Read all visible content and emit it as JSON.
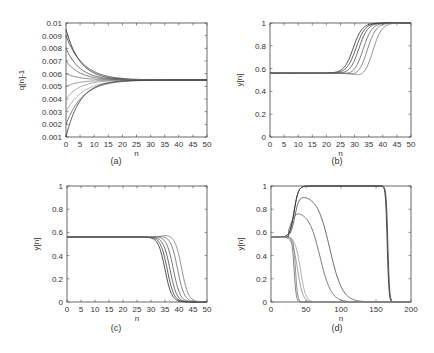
{
  "chart_data": [
    {
      "id": "a",
      "type": "line",
      "caption": "(a)",
      "xlabel": "n",
      "ylabel": "q[n]-1",
      "xlim": [
        0,
        50
      ],
      "ylim": [
        0.001,
        0.01
      ],
      "xticks": [
        "0",
        "5",
        "10",
        "15",
        "20",
        "25",
        "30",
        "35",
        "40",
        "45",
        "50"
      ],
      "yticks": [
        "0.001",
        "0.002",
        "0.003",
        "0.004",
        "0.005",
        "0.006",
        "0.007",
        "0.008",
        "0.009",
        "0.01"
      ],
      "grid": false,
      "description": "Multiple curves starting at different initial values (0.001 to 0.0095) converging to ~0.0055 by n≈25",
      "series": [
        {
          "name": "s1",
          "start": 0.0095,
          "end": 0.0055,
          "tau": 5
        },
        {
          "name": "s2",
          "start": 0.009,
          "end": 0.0055,
          "tau": 6
        },
        {
          "name": "s3",
          "start": 0.008,
          "end": 0.0055,
          "tau": 5
        },
        {
          "name": "s4",
          "start": 0.007,
          "end": 0.0055,
          "tau": 5
        },
        {
          "name": "s5",
          "start": 0.006,
          "end": 0.0055,
          "tau": 5
        },
        {
          "name": "s6",
          "start": 0.005,
          "end": 0.0055,
          "tau": 5
        },
        {
          "name": "s7",
          "start": 0.004,
          "end": 0.0055,
          "tau": 5
        },
        {
          "name": "s8",
          "start": 0.003,
          "end": 0.0055,
          "tau": 6
        },
        {
          "name": "s9",
          "start": 0.002,
          "end": 0.0055,
          "tau": 6
        },
        {
          "name": "s10",
          "start": 0.001,
          "end": 0.0055,
          "tau": 5
        }
      ]
    },
    {
      "id": "b",
      "type": "line",
      "caption": "(b)",
      "xlabel": "n",
      "ylabel": "y[n]",
      "xlim": [
        0,
        50
      ],
      "ylim": [
        0,
        1
      ],
      "xticks": [
        "0",
        "5",
        "10",
        "15",
        "20",
        "25",
        "30",
        "35",
        "40",
        "45",
        "50"
      ],
      "yticks": [
        "0",
        "0.2",
        "0.4",
        "0.6",
        "0.8",
        "1"
      ],
      "grid": false,
      "description": "Curves flat at ~0.56 then rising sigmoidally to 1 between n≈25 and n≈40",
      "series": [
        {
          "name": "s1",
          "base": 0.56,
          "mid": 29.5,
          "dip": 0.0
        },
        {
          "name": "s2",
          "base": 0.56,
          "mid": 30.5,
          "dip": 0.0
        },
        {
          "name": "s3",
          "base": 0.56,
          "mid": 31.5,
          "dip": 0.01
        },
        {
          "name": "s4",
          "base": 0.56,
          "mid": 33.0,
          "dip": 0.02
        },
        {
          "name": "s5",
          "base": 0.56,
          "mid": 34.5,
          "dip": 0.03
        },
        {
          "name": "s6",
          "base": 0.56,
          "mid": 36.5,
          "dip": 0.04
        }
      ]
    },
    {
      "id": "c",
      "type": "line",
      "caption": "(c)",
      "xlabel": "n",
      "ylabel": "y[n]",
      "xlim": [
        0,
        50
      ],
      "ylim": [
        0,
        1
      ],
      "xticks": [
        "0",
        "5",
        "10",
        "15",
        "20",
        "25",
        "30",
        "35",
        "40",
        "45",
        "50"
      ],
      "yticks": [
        "0",
        "0.2",
        "0.4",
        "0.6",
        "0.8",
        "1"
      ],
      "grid": false,
      "description": "Curves flat at ~0.56 then falling sigmoidally to 0 between n≈30 and n≈44",
      "series": [
        {
          "name": "s1",
          "base": 0.56,
          "mid": 35.0,
          "bump": 0.0
        },
        {
          "name": "s2",
          "base": 0.56,
          "mid": 35.8,
          "bump": 0.0
        },
        {
          "name": "s3",
          "base": 0.56,
          "mid": 36.8,
          "bump": 0.0
        },
        {
          "name": "s4",
          "base": 0.56,
          "mid": 38.0,
          "bump": 0.005
        },
        {
          "name": "s5",
          "base": 0.56,
          "mid": 39.5,
          "bump": 0.01
        },
        {
          "name": "s6",
          "base": 0.56,
          "mid": 41.0,
          "bump": 0.02
        }
      ]
    },
    {
      "id": "d",
      "type": "line",
      "caption": "(d)",
      "xlabel": "n",
      "ylabel": "y[n]",
      "xlim": [
        0,
        200
      ],
      "ylim": [
        0,
        1
      ],
      "xticks": [
        "0",
        "50",
        "100",
        "150",
        "200"
      ],
      "yticks": [
        "0",
        "0.2",
        "0.4",
        "0.6",
        "0.8",
        "1"
      ],
      "grid": false,
      "description": "Curves starting at ~0.56; some rise to 1 and stay until n≈165 then drop, some peak at 0.92 and 0.78 then decay, others drop to 0 near n≈35-60",
      "series": [
        {
          "name": "plateau1",
          "base": 0.56,
          "peak": 1.0,
          "fall_mid": 166
        },
        {
          "name": "plateau2",
          "base": 0.56,
          "peak": 1.0,
          "fall_mid": 167
        },
        {
          "name": "hump1",
          "base": 0.56,
          "peak": 0.92,
          "peak_n": 46,
          "decay_to": 0
        },
        {
          "name": "hump2",
          "base": 0.56,
          "peak": 0.78,
          "peak_n": 40,
          "decay_to": 0
        },
        {
          "name": "drop1",
          "base": 0.56,
          "drop_mid": 33
        },
        {
          "name": "drop2",
          "base": 0.56,
          "drop_mid": 35
        },
        {
          "name": "drop3",
          "base": 0.56,
          "drop_mid": 38
        },
        {
          "name": "drop4",
          "base": 0.56,
          "drop_mid": 42
        }
      ]
    }
  ],
  "panels": {
    "a": {
      "caption": "(a)",
      "xlabel": "n",
      "ylabel": "q[n]-1"
    },
    "b": {
      "caption": "(b)",
      "xlabel": "n",
      "ylabel": "y[n]"
    },
    "c": {
      "caption": "(c)",
      "xlabel": "n",
      "ylabel": "y[n]"
    },
    "d": {
      "caption": "(d)",
      "xlabel": "n",
      "ylabel": "y[n]"
    }
  }
}
